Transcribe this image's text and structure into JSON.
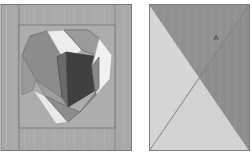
{
  "figure": {
    "background_color": "#ffffff",
    "width": 252,
    "height": 161
  },
  "palette": {
    "background": "#ffffff",
    "frame_gray": "#a8a8a8",
    "frame_gray_light": "#b2b2b2",
    "outline": "#6f6f6f",
    "outline_soft": "#8a8a8a",
    "heart_dark": "#3d3d3d",
    "heart_mid_dark": "#5e5e5e",
    "heart_mid": "#7d7d7d",
    "heart_gray": "#949494",
    "heart_light": "#d6d6d6",
    "heart_white": "#eeeeee",
    "block_b_dark": "#8f8f8f",
    "block_b_light": "#d3d3d3",
    "label_color": "#3a3a3a"
  },
  "blocks": [
    {
      "id": "heart-block",
      "name": "Heart block",
      "label": "",
      "x": 1,
      "y": 4,
      "width": 131,
      "height": 147,
      "inner_frame": {
        "x": 19,
        "y": 25,
        "width": 96,
        "height": 103
      },
      "pieces": [
        {
          "name": "outer-frame-field",
          "color": "#a8a8a8"
        },
        {
          "name": "inner-frame-field",
          "color": "#b0b0b0"
        },
        {
          "name": "heart-lobe-left-gray",
          "color": "#8b8b8b"
        },
        {
          "name": "heart-notch-white-left",
          "color": "#ededed"
        },
        {
          "name": "heart-lobe-right-gray",
          "color": "#9a9a9a"
        },
        {
          "name": "heart-center-dark",
          "color": "#3f3f3f"
        },
        {
          "name": "heart-center-mid",
          "color": "#6a6a6a"
        },
        {
          "name": "heart-right-white-wedge",
          "color": "#f0f0f0"
        },
        {
          "name": "heart-right-mid-wedge",
          "color": "#8a8a8a"
        },
        {
          "name": "heart-bottom-white-wedge",
          "color": "#e8e8e8"
        },
        {
          "name": "heart-bottom-left-mid",
          "color": "#9d9d9d"
        },
        {
          "name": "heart-bottom-right-mid",
          "color": "#8d8d8d"
        }
      ]
    },
    {
      "id": "quarter-square-block",
      "name": "Quarter square triangle block",
      "label": "A",
      "x": 149,
      "y": 4,
      "width": 101,
      "height": 147,
      "label_x": 216,
      "label_y": 38,
      "triangles": [
        {
          "name": "triangle-top",
          "color": "#8f8f8f"
        },
        {
          "name": "triangle-right",
          "color": "#8f8f8f"
        },
        {
          "name": "triangle-left",
          "color": "#d4d4d4"
        },
        {
          "name": "triangle-bottom",
          "color": "#d4d4d4"
        }
      ]
    }
  ]
}
